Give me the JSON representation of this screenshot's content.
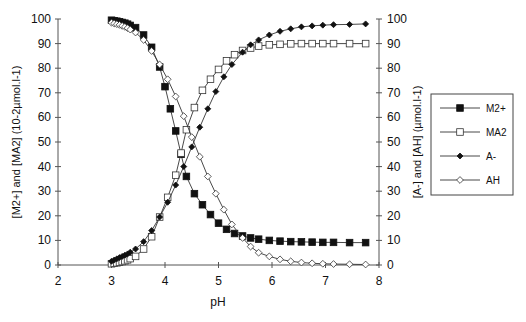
{
  "chart_data": {
    "type": "line",
    "title": "",
    "xlabel": "pH",
    "ylabel_left": "[M2+] and [MA2] (10-2µmol.l-1)",
    "ylabel_right": "[A-] and [AH] (µmol.l-1)",
    "xlim": [
      2,
      8
    ],
    "ylim_left": [
      0,
      100
    ],
    "ylim_right": [
      0,
      100
    ],
    "x_ticks": [
      "2",
      "3",
      "4",
      "5",
      "6",
      "7",
      "8"
    ],
    "y_ticks_left": [
      "0",
      "10",
      "20",
      "30",
      "40",
      "50",
      "60",
      "70",
      "80",
      "90",
      "100"
    ],
    "y_ticks_right": [
      "0",
      "10",
      "20",
      "30",
      "40",
      "50",
      "60",
      "70",
      "80",
      "90",
      "100"
    ],
    "grid": false,
    "legend_position": "right",
    "series": [
      {
        "name": "M2+",
        "axis": "left",
        "marker": "filled-square",
        "x": [
          3.0,
          3.05,
          3.1,
          3.15,
          3.2,
          3.25,
          3.3,
          3.35,
          3.45,
          3.6,
          3.75,
          3.9,
          4.0,
          4.1,
          4.2,
          4.3,
          4.4,
          4.55,
          4.7,
          4.85,
          5.0,
          5.15,
          5.3,
          5.45,
          5.6,
          5.75,
          5.95,
          6.15,
          6.35,
          6.55,
          6.75,
          6.95,
          7.15,
          7.45,
          7.75
        ],
        "y": [
          99.5,
          99.3,
          99.1,
          98.9,
          98.6,
          98.3,
          97.9,
          97.4,
          96.5,
          93.5,
          88.5,
          80.5,
          72.5,
          63.5,
          54.5,
          45,
          36,
          29,
          24.5,
          20.5,
          17,
          14.5,
          12.8,
          11.8,
          11,
          10.5,
          10,
          9.7,
          9.5,
          9.4,
          9.3,
          9.2,
          9.2,
          9.1,
          9.1
        ]
      },
      {
        "name": "MA2",
        "axis": "left",
        "marker": "open-square",
        "x": [
          3.0,
          3.05,
          3.1,
          3.15,
          3.2,
          3.25,
          3.3,
          3.35,
          3.45,
          3.6,
          3.75,
          3.9,
          4.05,
          4.2,
          4.3,
          4.4,
          4.55,
          4.7,
          4.85,
          5.0,
          5.15,
          5.3,
          5.45,
          5.6,
          5.75,
          5.95,
          6.15,
          6.35,
          6.55,
          6.75,
          6.95,
          7.15,
          7.45,
          7.75
        ],
        "y": [
          0.5,
          0.7,
          0.9,
          1.1,
          1.4,
          1.7,
          2.1,
          2.6,
          3.5,
          6.5,
          11.5,
          19.5,
          27.5,
          36.5,
          45.5,
          55,
          64,
          71,
          75.5,
          79.5,
          83,
          85.5,
          87.2,
          88.2,
          89,
          89.5,
          89.7,
          89.9,
          90,
          90,
          90,
          90,
          90,
          90
        ]
      },
      {
        "name": "A-",
        "axis": "right",
        "marker": "filled-diamond",
        "x": [
          3.0,
          3.05,
          3.1,
          3.15,
          3.2,
          3.25,
          3.3,
          3.35,
          3.45,
          3.6,
          3.75,
          3.9,
          4.05,
          4.2,
          4.35,
          4.5,
          4.65,
          4.8,
          4.95,
          5.1,
          5.25,
          5.45,
          5.6,
          5.75,
          5.95,
          6.15,
          6.35,
          6.55,
          6.75,
          6.95,
          7.15,
          7.45,
          7.75
        ],
        "y": [
          1.5,
          2,
          2.5,
          3,
          3.5,
          4,
          4.5,
          5.2,
          6.5,
          9.5,
          14,
          19.5,
          25.5,
          32.5,
          40,
          48,
          56,
          63.5,
          70.5,
          76.5,
          81.5,
          86.5,
          89.5,
          91.5,
          93.5,
          95,
          96,
          96.8,
          97.2,
          97.5,
          97.7,
          97.8,
          98
        ]
      },
      {
        "name": "AH",
        "axis": "right",
        "marker": "open-diamond",
        "x": [
          3.0,
          3.05,
          3.1,
          3.15,
          3.2,
          3.25,
          3.3,
          3.35,
          3.45,
          3.6,
          3.75,
          3.9,
          4.05,
          4.2,
          4.35,
          4.5,
          4.65,
          4.8,
          4.95,
          5.1,
          5.25,
          5.45,
          5.6,
          5.75,
          5.95,
          6.15,
          6.35,
          6.55,
          6.75,
          6.95,
          7.15,
          7.45,
          7.75
        ],
        "y": [
          98.5,
          98.2,
          97.9,
          97.6,
          97.2,
          96.8,
          96.3,
          95.7,
          94.5,
          91.5,
          87,
          81.5,
          75.5,
          68.5,
          60.5,
          52,
          44,
          36,
          29,
          22.5,
          16.5,
          11,
          7.5,
          5,
          3.5,
          2.3,
          1.5,
          1,
          0.7,
          0.5,
          0.4,
          0.3,
          0.2
        ]
      }
    ]
  }
}
